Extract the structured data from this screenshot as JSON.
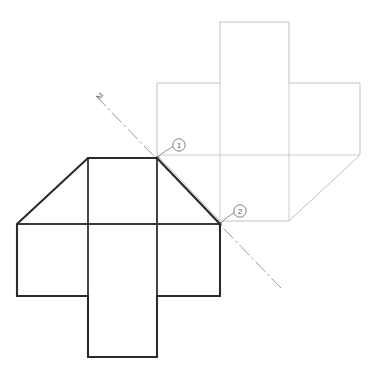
{
  "drawing": {
    "title": "Rotational symmetry net construction",
    "background_color": "#ffffff",
    "width": 373,
    "height": 382,
    "axis_label": "M",
    "colors": {
      "solid_outline": "#2b2b2b",
      "ghost_outline": "#b6b6b6",
      "centerline": "#8e8e8e",
      "leader": "#7a7a7a",
      "balloon_stroke": "#6f6f6f"
    },
    "balloons": [
      {
        "id": "balloon-1",
        "label": "1",
        "circle_cx": 179,
        "circle_cy": 145,
        "circle_r": 6.2,
        "anchor_x": 157,
        "anchor_y": 158,
        "leader_path": "M 173.2 146.4 C 168 150 162 152.5 157.6 157.4"
      },
      {
        "id": "balloon-2",
        "label": "2",
        "circle_cx": 240,
        "circle_cy": 211,
        "circle_r": 6.2,
        "anchor_x": 220,
        "anchor_y": 224,
        "leader_path": "M 234.3 212.6 C 229.5 215.8 224.6 218.6 220.6 223.3"
      }
    ],
    "solid_figure": {
      "name": "primary-net",
      "outline_path": "M 17 224 L 88 158 L 157 158 L 220 224 L 220 296 L 157 296 L 157 357 L 88 357 L 88 296 L 17 296 Z",
      "inner_lines": [
        "M 88 158 L 88 296",
        "M 157 158 L 157 296",
        "M 17 224 L 220 224"
      ]
    },
    "ghost_figure": {
      "name": "rotated-net-copy",
      "outline_path": "M 360 155 L 289 221 L 220 221 L 157 155 L 157 83 L 220 83 L 220 22 L 289 22 L 289 83 L 360 83 Z",
      "inner_lines": [
        "M 289 221 L 289 83",
        "M 220 221 L 220 83",
        "M 360 155 L 157 155"
      ]
    },
    "centerline": {
      "name": "symmetry-axis",
      "x1": 96,
      "y1": 96,
      "x2": 281,
      "y2": 288,
      "dash_pattern": "14 3 3 3",
      "label": "M",
      "label_x": 100,
      "label_y": 100,
      "label_rotation": -52
    },
    "vertices": [
      {
        "name": "vertex-1",
        "x": 157,
        "y": 158
      },
      {
        "name": "vertex-2",
        "x": 220,
        "y": 224
      }
    ]
  }
}
